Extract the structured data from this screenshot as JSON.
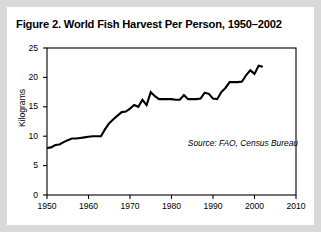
{
  "figure": {
    "title": "Figure 2. World Fish Harvest Per Person, 1950–2002",
    "source_note": "Source: FAO, Census Bureau"
  },
  "chart_data": {
    "type": "line",
    "title": "Figure 2. World Fish Harvest Per Person, 1950–2002",
    "xlabel": "",
    "ylabel": "Kilograms",
    "xlim": [
      1950,
      2010
    ],
    "ylim": [
      0,
      25
    ],
    "xticks": [
      "1950",
      "1960",
      "1970",
      "1980",
      "1990",
      "2000",
      "2010"
    ],
    "yticks": [
      "0",
      "5",
      "10",
      "15",
      "20",
      "25"
    ],
    "grid": false,
    "legend": null,
    "line_color": "#000000",
    "series": [
      {
        "name": "World fish harvest per person",
        "units": "kilograms",
        "x": [
          1950,
          1951,
          1952,
          1953,
          1954,
          1955,
          1956,
          1957,
          1958,
          1959,
          1960,
          1961,
          1962,
          1963,
          1964,
          1965,
          1966,
          1967,
          1968,
          1969,
          1970,
          1971,
          1972,
          1973,
          1974,
          1975,
          1976,
          1977,
          1978,
          1979,
          1980,
          1981,
          1982,
          1983,
          1984,
          1985,
          1986,
          1987,
          1988,
          1989,
          1990,
          1991,
          1992,
          1993,
          1994,
          1995,
          1996,
          1997,
          1998,
          1999,
          2000,
          2001,
          2002
        ],
        "values": [
          8.0,
          8.1,
          8.5,
          8.6,
          9.0,
          9.3,
          9.6,
          9.6,
          9.7,
          9.8,
          9.9,
          10.0,
          10.0,
          10.0,
          11.2,
          12.2,
          12.9,
          13.5,
          14.1,
          14.2,
          14.7,
          15.3,
          15.0,
          16.2,
          15.3,
          17.5,
          16.8,
          16.3,
          16.3,
          16.3,
          16.3,
          16.2,
          16.2,
          17.0,
          16.3,
          16.3,
          16.3,
          16.4,
          17.4,
          17.2,
          16.4,
          16.3,
          17.5,
          18.2,
          19.2,
          19.2,
          19.2,
          19.3,
          20.4,
          21.2,
          20.6,
          22.0,
          21.8
        ]
      }
    ]
  },
  "axes": {
    "y_ticks": [
      {
        "label": "25",
        "value": 25
      },
      {
        "label": "20",
        "value": 20
      },
      {
        "label": "15",
        "value": 15
      },
      {
        "label": "10",
        "value": 10
      },
      {
        "label": "5",
        "value": 5
      },
      {
        "label": "0",
        "value": 0
      }
    ],
    "x_ticks": [
      {
        "label": "1950",
        "value": 1950
      },
      {
        "label": "1960",
        "value": 1960
      },
      {
        "label": "1970",
        "value": 1970
      },
      {
        "label": "1980",
        "value": 1980
      },
      {
        "label": "1990",
        "value": 1990
      },
      {
        "label": "2000",
        "value": 2000
      },
      {
        "label": "2010",
        "value": 2010
      }
    ]
  }
}
